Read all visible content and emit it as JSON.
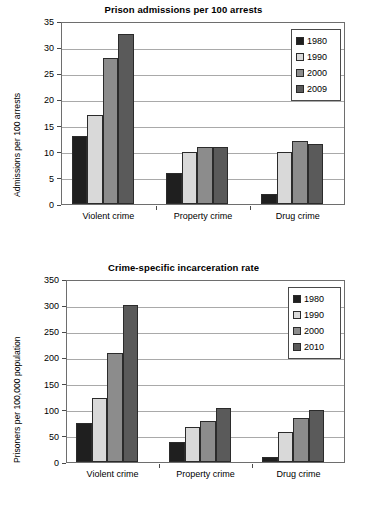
{
  "series_colors": {
    "s1980": "#1f1f1f",
    "s1990": "#d9d9d9",
    "s2000": "#8c8c8c",
    "s2010": "#5a5a5a"
  },
  "chart_data": [
    {
      "type": "bar",
      "title": "Prison admissions per 100 arrests",
      "xlabel": "",
      "ylabel": "Admissions per 100 arrests",
      "categories": [
        "Violent crime",
        "Property crime",
        "Drug crime"
      ],
      "yticks": [
        0,
        5,
        10,
        15,
        20,
        25,
        30,
        35
      ],
      "ylim": [
        0,
        35
      ],
      "grid": true,
      "legend_position": "top-right",
      "series": [
        {
          "name": "1980",
          "values": [
            13,
            6,
            2
          ]
        },
        {
          "name": "1990",
          "values": [
            17,
            10,
            10
          ]
        },
        {
          "name": "2000",
          "values": [
            28,
            11,
            12
          ]
        },
        {
          "name": "2009",
          "values": [
            32.5,
            11,
            11.5
          ]
        }
      ]
    },
    {
      "type": "bar",
      "title": "Crime-specific incarceration rate",
      "xlabel": "",
      "ylabel": "Prisoners per 100,000 population",
      "categories": [
        "Violent crime",
        "Property crime",
        "Drug crime"
      ],
      "yticks": [
        0,
        50,
        100,
        150,
        200,
        250,
        300,
        350
      ],
      "ylim": [
        0,
        350
      ],
      "grid": true,
      "legend_position": "top-right",
      "series": [
        {
          "name": "1980",
          "values": [
            75,
            39,
            9
          ]
        },
        {
          "name": "1990",
          "values": [
            122,
            67,
            57
          ]
        },
        {
          "name": "2000",
          "values": [
            208,
            79,
            84
          ]
        },
        {
          "name": "2010",
          "values": [
            300,
            103,
            99
          ]
        }
      ]
    }
  ]
}
